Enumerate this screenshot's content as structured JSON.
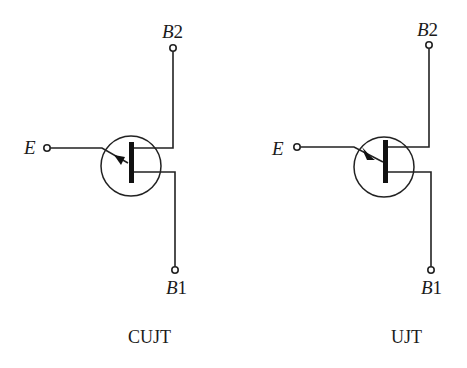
{
  "figure": {
    "symbols": [
      {
        "id": "cujt",
        "caption": "CUJT",
        "terminals": {
          "emitter": {
            "label": "E"
          },
          "base2": {
            "label_main": "B",
            "label_sub": "2"
          },
          "base1": {
            "label_main": "B",
            "label_sub": "1"
          }
        },
        "arrow_direction": "outward"
      },
      {
        "id": "ujt",
        "caption": "UJT",
        "terminals": {
          "emitter": {
            "label": "E"
          },
          "base2": {
            "label_main": "B",
            "label_sub": "2"
          },
          "base1": {
            "label_main": "B",
            "label_sub": "1"
          }
        },
        "arrow_direction": "inward"
      }
    ],
    "colors": {
      "ink": "#222222",
      "background": "#ffffff"
    }
  }
}
